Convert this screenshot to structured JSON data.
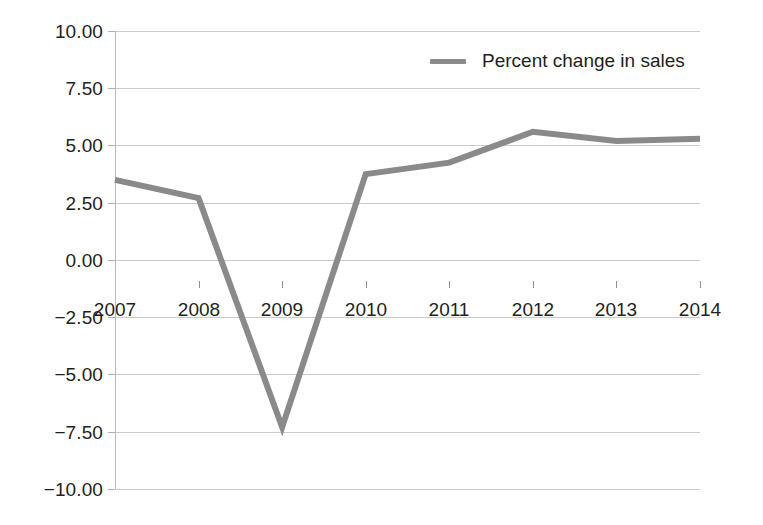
{
  "chart_data": {
    "type": "line",
    "title": "",
    "xlabel": "",
    "ylabel": "",
    "categories": [
      "2007",
      "2008",
      "2009",
      "2010",
      "2011",
      "2012",
      "2013",
      "2014"
    ],
    "x": [
      2007,
      2008,
      2009,
      2010,
      2011,
      2012,
      2013,
      2014
    ],
    "series": [
      {
        "name": "Percent change in sales",
        "color": "#8a8a8a",
        "values": [
          3.5,
          2.7,
          -7.3,
          3.75,
          4.25,
          5.6,
          5.2,
          5.3
        ]
      }
    ],
    "ylim": [
      -10.0,
      10.0
    ],
    "ytick_values": [
      10.0,
      7.5,
      5.0,
      2.5,
      0.0,
      -2.5,
      -5.0,
      -7.5,
      -10.0
    ],
    "ytick_labels": [
      "10.00",
      "7.50",
      "5.00",
      "2.50",
      "0.00",
      "−2.50",
      "−5.00",
      "−7.50",
      "−10.00"
    ],
    "xtick_labels": [
      "2007",
      "2008",
      "2009",
      "2010",
      "2011",
      "2012",
      "2013",
      "2014"
    ],
    "grid": true,
    "grid_axis": "y",
    "grid_color": "#c9cacb",
    "legend": {
      "position": "top-right",
      "entries": [
        {
          "label": "Percent change in sales",
          "color": "#8a8a8a",
          "marker": "line"
        }
      ]
    },
    "background_color": "#ffffff",
    "text_color": "#231f20"
  },
  "legend": {
    "label": "Percent change in sales"
  }
}
